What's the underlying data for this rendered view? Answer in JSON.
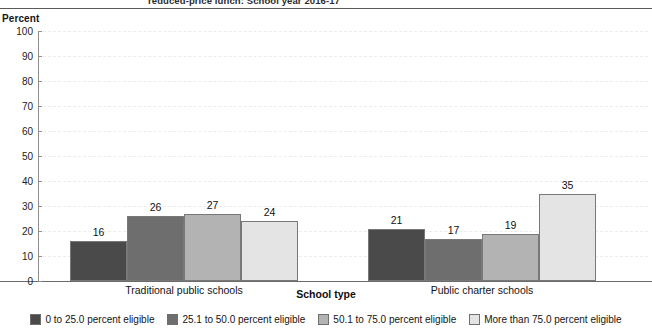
{
  "title_fragment": "reduced-price lunch: School year 2016-17",
  "axis": {
    "y_title": "Percent",
    "x_title": "School type",
    "y_ticks": [
      0,
      10,
      20,
      30,
      40,
      50,
      60,
      70,
      80,
      90,
      100
    ]
  },
  "legend": {
    "items": [
      {
        "label": "0 to 25.0 percent eligible",
        "color": "#4a4a4a"
      },
      {
        "label": "25.1 to 50.0 percent eligible",
        "color": "#6e6e6e"
      },
      {
        "label": "50.1 to 75.0 percent eligible",
        "color": "#b3b3b3"
      },
      {
        "label": "More than 75.0 percent eligible",
        "color": "#e4e4e4"
      }
    ]
  },
  "chart_data": {
    "type": "bar",
    "title": "reduced-price lunch: School year 2016-17",
    "xlabel": "School type",
    "ylabel": "Percent",
    "ylim": [
      0,
      100
    ],
    "ytick_step": 10,
    "grid": true,
    "legend_position": "bottom",
    "categories": [
      "Traditional public schools",
      "Public charter schools"
    ],
    "series": [
      {
        "name": "0 to 25.0 percent eligible",
        "color": "#4a4a4a",
        "values": [
          16,
          21
        ]
      },
      {
        "name": "25.1 to 50.0 percent eligible",
        "color": "#6e6e6e",
        "values": [
          26,
          17
        ]
      },
      {
        "name": "50.1 to 75.0 percent eligible",
        "color": "#b3b3b3",
        "values": [
          27,
          19
        ]
      },
      {
        "name": "More than 75.0 percent eligible",
        "color": "#e4e4e4",
        "values": [
          24,
          35
        ]
      }
    ]
  }
}
